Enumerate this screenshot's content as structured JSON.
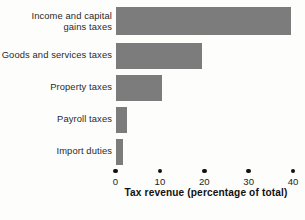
{
  "chart_data": {
    "type": "bar",
    "orientation": "horizontal",
    "title": "",
    "xlabel": "Tax revenue (percentage of total)",
    "ylabel": "",
    "categories": [
      "Income and capital\ngains taxes",
      "Goods and services taxes",
      "Property taxes",
      "Payroll taxes",
      "Import duties"
    ],
    "values": [
      39.5,
      19.5,
      10.5,
      2.5,
      1.5
    ],
    "xlim": [
      0,
      40
    ],
    "xticks": [
      0,
      10,
      20,
      30,
      40
    ],
    "xtick_labels": [
      "0",
      "10",
      "20",
      "30",
      "40"
    ],
    "grid": false,
    "legend": "none",
    "bar_color": "#7c7c7c",
    "axis_marker_style": "dot",
    "axis_marker_color": "#111111",
    "background_color": "#fdfdfc"
  }
}
